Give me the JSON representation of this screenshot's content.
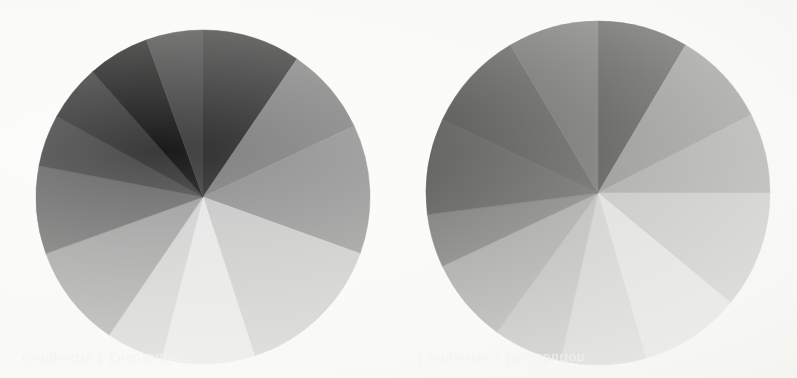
{
  "page": {
    "background_color": "#fcfcfb",
    "width": 797,
    "height": 378
  },
  "ghost_text": {
    "left": "Composite 1 Distribution",
    "right": "Composite 2 Distribution"
  },
  "chart_data": [
    {
      "id": "pie-left",
      "type": "pie",
      "title": "",
      "subtitle": "",
      "xlabel": "",
      "ylabel": "",
      "legend": "none",
      "grid": false,
      "center_x": 203,
      "center_y": 197,
      "radius": 167,
      "start_angle_deg": -90,
      "direction": "clockwise",
      "total": 100,
      "categories": [
        "Segment 1",
        "Segment 2",
        "Segment 3",
        "Segment 4",
        "Segment 5",
        "Segment 6",
        "Segment 7",
        "Segment 8",
        "Segment 9",
        "Segment 10",
        "Segment 11",
        "Segment 12"
      ],
      "values": [
        9.5,
        8.5,
        12.5,
        14.5,
        9.0,
        5.5,
        10.0,
        8.5,
        5.0,
        5.5,
        6.0,
        5.5
      ],
      "colors": [
        "#2e2e2e",
        "#7f7f7f",
        "#8f8f8f",
        "#c6c6c6",
        "#e6e6e6",
        "#cfcfcf",
        "#9c9c9c",
        "#6a6a6a",
        "#4e4e4e",
        "#3a3a3a",
        "#1a1a1a",
        "#3f3f3f"
      ]
    },
    {
      "id": "pie-right",
      "type": "pie",
      "title": "",
      "subtitle": "",
      "xlabel": "",
      "ylabel": "",
      "legend": "none",
      "grid": false,
      "center_x": 598,
      "center_y": 193,
      "radius": 172,
      "start_angle_deg": -90,
      "direction": "clockwise",
      "total": 100,
      "categories": [
        "Segment 1",
        "Segment 2",
        "Segment 3",
        "Segment 4",
        "Segment 5",
        "Segment 6",
        "Segment 7",
        "Segment 8",
        "Segment 9",
        "Segment 10",
        "Segment 11",
        "Segment 12"
      ],
      "values": [
        8.5,
        9.0,
        7.5,
        11.0,
        9.5,
        8.0,
        6.5,
        8.0,
        5.0,
        9.0,
        9.5,
        8.5
      ],
      "colors": [
        "#191919",
        "#6f6f6f",
        "#8a8a8a",
        "#b3b3b3",
        "#d8d8d8",
        "#c2c2c2",
        "#a6a6a6",
        "#8d8d8d",
        "#5e5e5e",
        "#3b3b3b",
        "#303030",
        "#454545"
      ]
    }
  ]
}
